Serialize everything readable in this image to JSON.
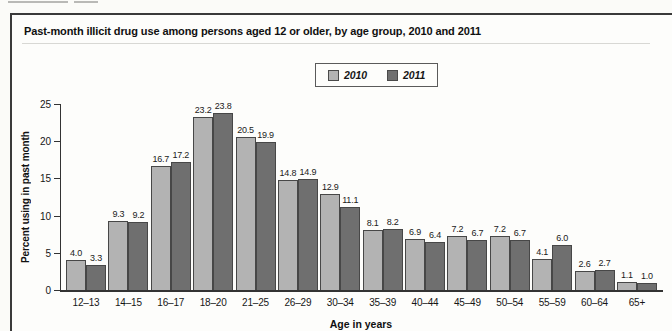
{
  "figure": {
    "title": "Past-month illicit drug use among persons aged 12 or older, by age group, 2010 and 2011"
  },
  "colors": {
    "bar_2010": "#b3b3b3",
    "bar_2011": "#6f6f6f",
    "axis": "#333333",
    "box_border": "#3a3a3a"
  },
  "chart_data": {
    "type": "bar",
    "title": "Past-month illicit drug use among persons aged 12 or older, by age group, 2010 and 2011",
    "categories": [
      "12–13",
      "14–15",
      "16–17",
      "18–20",
      "21–25",
      "26–29",
      "30–34",
      "35–39",
      "40–44",
      "45–49",
      "50–54",
      "55–59",
      "60–64",
      "65+"
    ],
    "series": [
      {
        "name": "2010",
        "color": "#b3b3b3",
        "values": [
          4.0,
          9.3,
          16.7,
          23.2,
          20.5,
          14.8,
          12.9,
          8.1,
          6.9,
          7.2,
          7.2,
          4.1,
          2.6,
          1.1
        ]
      },
      {
        "name": "2011",
        "color": "#6f6f6f",
        "values": [
          3.3,
          9.2,
          17.2,
          23.8,
          19.9,
          14.9,
          11.1,
          8.2,
          6.4,
          6.7,
          6.7,
          6.0,
          2.7,
          1.0
        ]
      }
    ],
    "xlabel": "Age in years",
    "ylabel": "Percent using in past month",
    "ylim": [
      0,
      25
    ],
    "yticks": [
      0,
      5,
      10,
      15,
      20,
      25
    ],
    "grid": false,
    "legend_position": "top-center",
    "bar_labels": true,
    "bar_label_decimals": 1
  }
}
